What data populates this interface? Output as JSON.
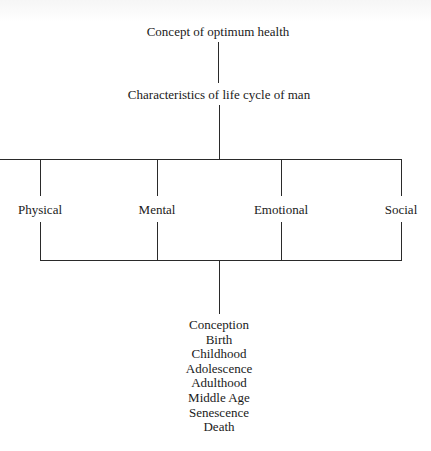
{
  "diagram": {
    "root": "Concept of optimum health",
    "level2": "Characteristics of life cycle of man",
    "aspects": [
      "Physical",
      "Mental",
      "Emotional",
      "Social"
    ],
    "life_stages": [
      "Conception",
      "Birth",
      "Childhood",
      "Adolescence",
      "Adulthood",
      "Middle Age",
      "Senescence",
      "Death"
    ],
    "line_color": "#2a2a2a",
    "text_color": "#1a1a1a"
  }
}
